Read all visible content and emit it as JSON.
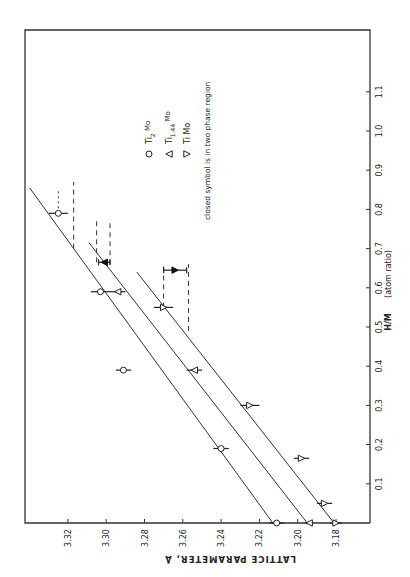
{
  "chart_data": {
    "type": "scatter",
    "orientation_note": "figure printed rotated 90 degrees counter-clockwise",
    "title": "",
    "xlabel": "H/M",
    "xlabel_units": "(atom ratio)",
    "ylabel": "LATTICE PARAMETER, Å",
    "xlim": [
      0,
      1.18
    ],
    "ylim": [
      3.17,
      3.345
    ],
    "x_ticks": [
      0.1,
      0.2,
      0.3,
      0.4,
      0.5,
      0.6,
      0.7,
      0.8,
      0.9,
      1.0,
      1.1
    ],
    "x_tick_labels": [
      "0.1",
      "0.2",
      "0.3",
      "0.4",
      "0.5",
      "0.6",
      "0.7",
      "0.8",
      "0.9",
      "1.0",
      "1.1"
    ],
    "y_ticks": [
      3.18,
      3.2,
      3.22,
      3.24,
      3.26,
      3.28,
      3.3,
      3.32
    ],
    "y_tick_labels": [
      "3.18",
      "3.20",
      "3.22",
      "3.24",
      "3.26",
      "3.28",
      "3.30",
      "3.32"
    ],
    "grid": false,
    "legend": {
      "placement": "upper-middle",
      "entries": [
        {
          "symbol": "circle",
          "label": "Ti",
          "sub": "2",
          "suffix": "Mo",
          "sup": ""
        },
        {
          "symbol": "triangle-up",
          "label": "Ti",
          "sub": "1.44",
          "suffix": "Mo",
          "sup": ""
        },
        {
          "symbol": "triangle-down",
          "label": "Ti Mo",
          "sub": "",
          "suffix": "",
          "sup": ""
        }
      ],
      "note": "closed symbol is in two phase region"
    },
    "series": [
      {
        "name": "Ti2Mo",
        "marker": "circle",
        "points": [
          {
            "x": 0.0,
            "y": 3.211,
            "xerr": 0.0,
            "yerr": 0.004,
            "closed": false
          },
          {
            "x": 0.19,
            "y": 3.24,
            "xerr": 0.0,
            "yerr": 0.004,
            "closed": false
          },
          {
            "x": 0.39,
            "y": 3.291,
            "xerr": 0.0,
            "yerr": 0.004,
            "closed": false
          },
          {
            "x": 0.59,
            "y": 3.303,
            "xerr": 0.0,
            "yerr": 0.005,
            "closed": false
          },
          {
            "x": 0.79,
            "y": 3.325,
            "xerr": 0.0,
            "yerr": 0.005,
            "closed": false
          }
        ],
        "fit_line": {
          "x": [
            0.0,
            0.855
          ],
          "y": [
            3.213,
            3.34
          ]
        },
        "phase_bounds": [
          {
            "y": 3.325,
            "x": [
              0.79,
              0.85
            ],
            "style": "dotted"
          },
          {
            "y": 3.317,
            "x": [
              0.7,
              0.87
            ],
            "style": "dashed"
          }
        ]
      },
      {
        "name": "Ti1.44Mo",
        "marker": "triangle-up",
        "points": [
          {
            "x": 0.0,
            "y": 3.194,
            "xerr": 0.0,
            "yerr": 0.002,
            "closed": false
          },
          {
            "x": 0.39,
            "y": 3.254,
            "xerr": 0.0,
            "yerr": 0.004,
            "closed": false
          },
          {
            "x": 0.59,
            "y": 3.294,
            "xerr": 0.0,
            "yerr": 0.004,
            "closed": false
          },
          {
            "x": 0.665,
            "y": 3.301,
            "xerr": 0.0,
            "yerr": 0.003,
            "closed": true
          }
        ],
        "fit_line": {
          "x": [
            0.0,
            0.715
          ],
          "y": [
            3.195,
            3.309
          ]
        },
        "phase_bounds": [
          {
            "y": 3.305,
            "x": [
              0.665,
              0.77
            ],
            "style": "dashed"
          },
          {
            "y": 3.298,
            "x": [
              0.66,
              0.77
            ],
            "style": "dashed"
          }
        ]
      },
      {
        "name": "TiMo",
        "marker": "triangle-down",
        "points": [
          {
            "x": 0.0,
            "y": 3.18,
            "xerr": 0.0,
            "yerr": 0.003,
            "closed": false
          },
          {
            "x": 0.05,
            "y": 3.186,
            "xerr": 0.0,
            "yerr": 0.004,
            "closed": false
          },
          {
            "x": 0.165,
            "y": 3.198,
            "xerr": 0.0,
            "yerr": 0.004,
            "closed": false
          },
          {
            "x": 0.3,
            "y": 3.225,
            "xerr": 0.0,
            "yerr": 0.005,
            "closed": false
          },
          {
            "x": 0.55,
            "y": 3.27,
            "xerr": 0.0,
            "yerr": 0.005,
            "closed": false
          },
          {
            "x": 0.645,
            "y": 3.264,
            "xerr": 0.0,
            "yerr": 0.006,
            "closed": true
          }
        ],
        "fit_line": {
          "x": [
            0.0,
            0.64
          ],
          "y": [
            3.181,
            3.284
          ]
        },
        "phase_bounds": [
          {
            "y": 3.27,
            "x": [
              0.55,
              0.66
            ],
            "style": "dashed"
          },
          {
            "y": 3.257,
            "x": [
              0.49,
              0.66
            ],
            "style": "dashed"
          }
        ]
      }
    ]
  }
}
